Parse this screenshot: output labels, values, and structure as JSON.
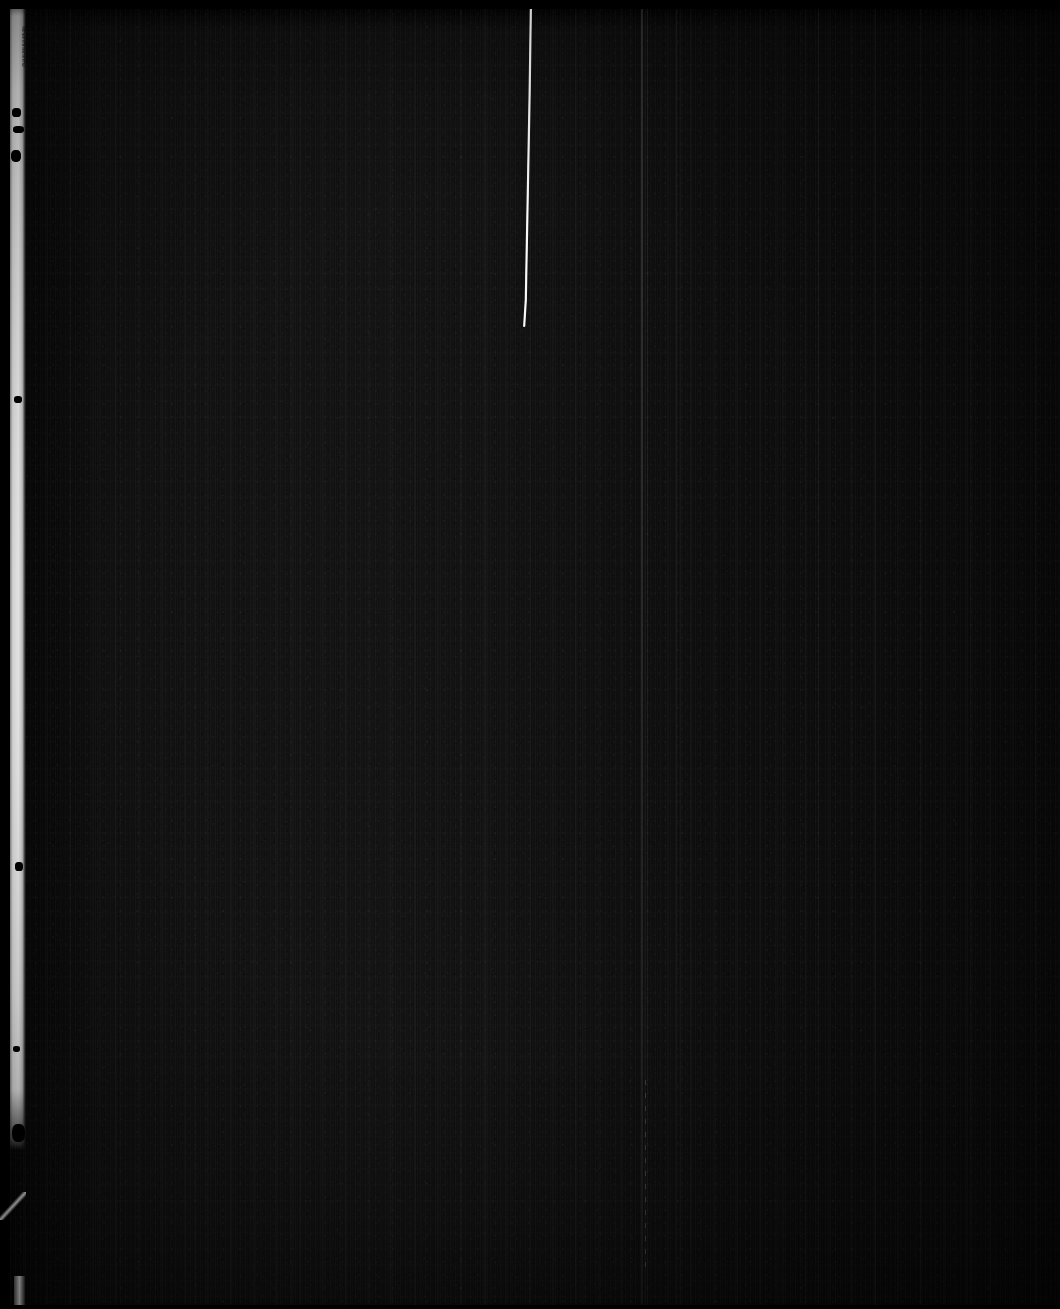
{
  "image": {
    "kind": "microfilm-negative-scan",
    "title": "Underexposed microfilm frame",
    "width_px": 1060,
    "height_px": 1309,
    "overall_appearance": "Near-black, heavily underexposed scanned page with vertical film grain striations"
  },
  "palette": {
    "background": "#000000",
    "emulsion_base": "#0a0a0b",
    "emulsion_light_band": "#131314",
    "emulsion_dark_edge": "#050505",
    "film_edge_white": "#ffffff",
    "scratch_white": "#f2f2f2",
    "hairline_grey": "#9a9a9a"
  },
  "artifacts": {
    "film_edge_strip": {
      "name": "left film edge light leak",
      "left_px": 9,
      "width_px": 17,
      "top_px": 0,
      "height_px": 1150,
      "color": "#ffffff"
    },
    "edge_fragment": {
      "name": "bottom-left bright fragment",
      "left_px": 14,
      "top_px": 1276,
      "width_px": 11,
      "height_px": 33
    },
    "edge_nick": {
      "name": "lower-left diagonal bright nick",
      "left_px": 0,
      "top_px": 1192,
      "width_px": 26,
      "height_px": 28
    },
    "scratch": {
      "name": "bright emulsion scratch",
      "start_x": 531,
      "start_y": 0,
      "end_x": 524,
      "end_y": 326,
      "color": "#f2f2f2"
    },
    "hairlines": [
      {
        "x_px": 641,
        "opacity": 0.14
      },
      {
        "x_px": 647,
        "opacity": 0.07
      },
      {
        "x_px": 676,
        "opacity": 0.05
      },
      {
        "x_px": 818,
        "opacity": 0.05
      }
    ],
    "dashed_line": {
      "x_px": 645,
      "top_px": 1080,
      "height_px": 190
    },
    "blots": [
      {
        "left_px": 12,
        "top_px": 108,
        "w": 9,
        "h": 9
      },
      {
        "left_px": 13,
        "top_px": 126,
        "w": 11,
        "h": 7
      },
      {
        "left_px": 11,
        "top_px": 150,
        "w": 10,
        "h": 12
      },
      {
        "left_px": 14,
        "top_px": 396,
        "w": 8,
        "h": 7
      },
      {
        "left_px": 15,
        "top_px": 862,
        "w": 8,
        "h": 9
      },
      {
        "left_px": 12,
        "top_px": 1124,
        "w": 13,
        "h": 18
      },
      {
        "left_px": 13,
        "top_px": 1046,
        "w": 7,
        "h": 6
      }
    ]
  },
  "margin_note": {
    "text": "illegible handwritten marginalia",
    "rendered_glyphs": "Mmwmmlmwmmmw"
  }
}
